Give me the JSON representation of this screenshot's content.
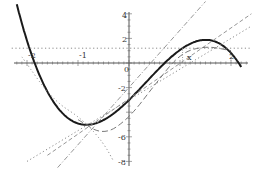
{
  "chart_data": {
    "type": "line",
    "title": "",
    "xlabel": "",
    "ylabel": "",
    "xlim": [
      -2.3,
      2.4
    ],
    "ylim": [
      -8.3,
      4.3
    ],
    "grid": false,
    "x_ticks": [
      "-2",
      "-1",
      "0",
      "2"
    ],
    "y_ticks": [
      "4",
      "2",
      "-2",
      "-6",
      "-8"
    ],
    "annotations": [
      {
        "text": "x",
        "x": 1.1,
        "y": 0.5
      }
    ],
    "series": [
      {
        "name": "f(x) cubic",
        "style": "solid-thick",
        "formula": "-1.08*(x+1.85)*(x-0.7)*(x-2.15)",
        "x": [
          -2.2,
          -2.0,
          -1.5,
          -1.0,
          -0.9,
          -0.5,
          0.0,
          0.5,
          1.0,
          1.5,
          1.7,
          2.0,
          2.2
        ],
        "values": [
          4.8,
          1.5,
          -2.8,
          -4.9,
          -5.0,
          -4.5,
          -3.0,
          -0.9,
          1.0,
          1.9,
          1.7,
          0.8,
          -0.3
        ]
      },
      {
        "name": "constant approximation",
        "style": "dotted",
        "x": [
          -2.3,
          2.4
        ],
        "values": [
          1.2,
          1.2
        ]
      },
      {
        "name": "linear approximation",
        "style": "dashed",
        "x": [
          -1.6,
          2.4
        ],
        "values": [
          -7.5,
          4.0
        ]
      },
      {
        "name": "tangent at x",
        "style": "dotted",
        "x": [
          -2.0,
          2.4
        ],
        "values": [
          -8.0,
          3.0
        ]
      },
      {
        "name": "steep secant",
        "style": "dash-dot",
        "x": [
          -1.4,
          1.5
        ],
        "values": [
          -8.5,
          5.0
        ]
      },
      {
        "name": "quadratic approximation",
        "style": "dash-long",
        "x": [
          -1.0,
          -0.5,
          0.0,
          0.5,
          1.0,
          1.5,
          2.0
        ],
        "values": [
          -4.6,
          -5.9,
          -4.5,
          -1.8,
          0.8,
          1.4,
          1.0
        ]
      },
      {
        "name": "parabola through minimum",
        "style": "dotted",
        "x": [
          -2.1,
          -1.5,
          -0.9,
          -0.5,
          -0.3
        ],
        "values": [
          0.5,
          -3.0,
          -4.6,
          -6.5,
          -8.0
        ]
      }
    ]
  },
  "axes": {
    "x_labels": [
      {
        "text": "-2",
        "px": 28,
        "py": 58
      },
      {
        "text": "-1",
        "px": 79,
        "py": 58
      },
      {
        "text": "0",
        "px": 124,
        "py": 72
      },
      {
        "text": "2",
        "px": 229,
        "py": 59
      }
    ],
    "y_labels": [
      {
        "text": "4",
        "px": 122,
        "py": 18
      },
      {
        "text": "2",
        "px": 122,
        "py": 42
      },
      {
        "text": "-2",
        "px": 118,
        "py": 91
      },
      {
        "text": "-6",
        "px": 118,
        "py": 140
      },
      {
        "text": "-8",
        "px": 118,
        "py": 165
      }
    ],
    "point_label": "x"
  }
}
